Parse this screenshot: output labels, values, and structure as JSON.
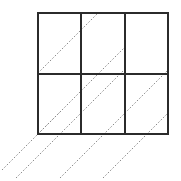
{
  "figure": {
    "title": "",
    "background_color": "#ffffff",
    "width": 181,
    "height": 181
  },
  "chart_data": {
    "type": "diagram",
    "subtype": "grid-with-diagonals",
    "title": "",
    "subtitle": "",
    "xlabel": "",
    "ylabel": "",
    "grid": {
      "columns": 3,
      "rows": 2,
      "x_left": 38,
      "x_right": 168,
      "y_top": 13,
      "y_bottom": 134,
      "cell_width": 43.33,
      "cell_height": 60.5,
      "vertical_divider_x": [
        81.33,
        124.67
      ],
      "horizontal_divider_y": [
        73.5
      ],
      "stroke_color": "#2b2b2b",
      "stroke_width": 2,
      "fill": "none"
    },
    "diagonals": {
      "angle_degrees": 45,
      "direction": "up-right",
      "stroke_color": "#8a8a8a",
      "stroke_width": 1,
      "dash_pattern": [
        1.6,
        1.8
      ],
      "count": 6,
      "spacing_px": 43.33,
      "description": "Parallel dotted lines at 45 degrees crossing the grid, several extending past the left and bottom edges",
      "lines": [
        {
          "x1": 2,
          "y1": 170,
          "x2": 62,
          "y2": 110
        },
        {
          "x1": 16,
          "y1": 178,
          "x2": 125,
          "y2": 69
        },
        {
          "x1": 60,
          "y1": 178,
          "x2": 168,
          "y2": 70
        },
        {
          "x1": 103,
          "y1": 178,
          "x2": 168,
          "y2": 113
        },
        {
          "x1": 38,
          "y1": 134,
          "x2": 125,
          "y2": 47
        },
        {
          "x1": 38,
          "y1": 73,
          "x2": 98,
          "y2": 13
        }
      ]
    },
    "legend": {
      "entries": [],
      "position": "none"
    },
    "annotations": []
  }
}
